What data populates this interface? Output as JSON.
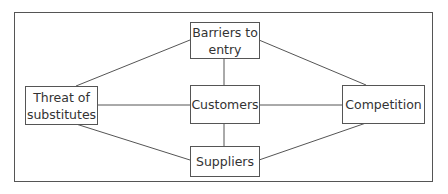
{
  "diagram": {
    "nodes": [
      {
        "id": "barriers",
        "label": "Barriers to entry",
        "line1": "Barriers to",
        "line2": "entry"
      },
      {
        "id": "threat",
        "label": "Threat of substitutes",
        "line1": "Threat of",
        "line2": "substitutes"
      },
      {
        "id": "customers",
        "label": "Customers"
      },
      {
        "id": "competition",
        "label": "Competition"
      },
      {
        "id": "suppliers",
        "label": "Suppliers"
      }
    ],
    "edges": [
      [
        "barriers",
        "threat"
      ],
      [
        "barriers",
        "customers"
      ],
      [
        "barriers",
        "competition"
      ],
      [
        "threat",
        "customers"
      ],
      [
        "customers",
        "competition"
      ],
      [
        "customers",
        "suppliers"
      ],
      [
        "threat",
        "suppliers"
      ],
      [
        "suppliers",
        "competition"
      ]
    ],
    "colors": {
      "stroke": "#555555",
      "text": "#333333",
      "background": "#ffffff"
    }
  }
}
